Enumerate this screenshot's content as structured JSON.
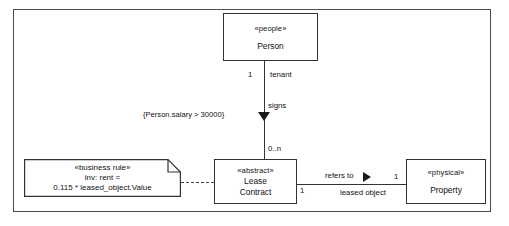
{
  "diagram": {
    "type": "uml-class-diagram",
    "frame_label": ""
  },
  "classes": [
    {
      "id": "person",
      "stereotype": "«people»",
      "name": "Person"
    },
    {
      "id": "lease",
      "stereotype": "«abstract»",
      "name_line1": "Lease",
      "name_line2": "Contract"
    },
    {
      "id": "property",
      "stereotype": "«physical»",
      "name": "Property"
    }
  ],
  "note": {
    "stereotype": "«business rule»",
    "line2": "inv: rent =",
    "line3": "0.115 * leased_object.Value"
  },
  "associations": [
    {
      "id": "signs",
      "from": "person",
      "to": "lease",
      "name": "signs",
      "direction_marker": "filled-triangle-down",
      "source_multiplicity": "1",
      "source_role": "tenant",
      "target_multiplicity": "0..n",
      "constraint": "{Person.salary  > 30000}"
    },
    {
      "id": "refers-to",
      "from": "lease",
      "to": "property",
      "name": "refers to",
      "direction_marker": "filled-triangle-right",
      "source_multiplicity": "1",
      "target_multiplicity": "1",
      "target_role": "leased object"
    }
  ],
  "colors": {
    "stroke": "#333333",
    "frame_stroke": "#4d4d4d",
    "text": "#111111",
    "background": "#ffffff",
    "marker_fill": "#1a1a1a"
  }
}
